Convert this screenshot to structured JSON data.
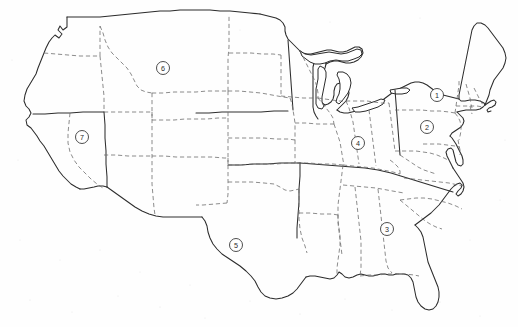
{
  "document": {
    "kind": "outline-map",
    "subject": "United States",
    "width": 518,
    "height": 327,
    "background_color": "#fefefe",
    "ink_color": "#2b2b2b",
    "state_border_color": "#6f6f6f",
    "render_style": "photocopied line drawing, no labels"
  },
  "legend": {
    "coast_line_style": "solid",
    "region_divider_style": "solid",
    "state_divider_style": "dashed"
  },
  "markers": [
    {
      "id": "marker-1",
      "label": "1",
      "cx": 437,
      "cy": 95,
      "r": 6.5,
      "region": "New York / New England"
    },
    {
      "id": "marker-2",
      "label": "2",
      "cx": 427,
      "cy": 127,
      "r": 6.5,
      "region": "Pennsylvania / Mid-Atlantic"
    },
    {
      "id": "marker-3",
      "label": "3",
      "cx": 387,
      "cy": 229,
      "r": 6.5,
      "region": "Georgia / South Carolina"
    },
    {
      "id": "marker-4",
      "label": "4",
      "cx": 358,
      "cy": 143,
      "r": 6.5,
      "region": "Indiana / Ohio"
    },
    {
      "id": "marker-5",
      "label": "5",
      "cx": 236,
      "cy": 245,
      "r": 6.5,
      "region": "Texas"
    },
    {
      "id": "marker-6",
      "label": "6",
      "cx": 163,
      "cy": 68,
      "r": 6.5,
      "region": "Montana"
    },
    {
      "id": "marker-7",
      "label": "7",
      "cx": 82,
      "cy": 137,
      "r": 6.5,
      "region": "Nevada / Utah"
    }
  ],
  "geometry": {
    "outline": "M 38 118 L 36 110 L 33 103 L 31 96 L 32 90 L 34 84 L 38 80 L 42 74 L 46 69 L 49 62 L 52 56 L 55 50 L 58 44 L 60 38 L 62 32 L 64 26 L 66 21 L 68 18 L 70 20 L 71 26 L 70 32 L 72 36 L 76 33 L 79 29 L 81 24 L 83 20 L 86 18 L 88 22 L 87 28 L 85 33 L 84 38 L 86 41 L 90 40 L 95 37 L 100 33 L 104 29 L 108 26 L 112 23 L 117 21 L 122 19 L 128 17 L 135 15 L 143 13 L 152 12 L 162 11 L 173 10 L 185 9 L 197 9 L 210 9 L 222 9 L 234 10 L 246 11 L 258 12 L 268 14 L 276 17 L 282 22 L 285 28 L 286 34 L 288 40 L 292 44 L 297 47 L 303 49 L 310 50 L 316 50 L 321 48 L 325 45 L 328 42 L 331 44 L 333 48 L 334 53 L 336 57 L 340 60 L 345 61 L 350 60 L 354 57 L 357 53 L 360 49 L 364 46 L 368 44 L 372 45 L 375 48 L 377 52 L 378 57 L 380 61 L 384 64 L 389 65 L 394 64 L 399 62 L 404 59 L 409 56 L 414 52 L 419 48 L 424 44 L 429 41 L 434 38 L 439 34 L 443 30 L 446 25 L 449 20 L 452 16 L 456 13 L 461 12 L 466 13 L 470 16 L 473 20 L 476 25 L 479 30 L 482 35 L 485 40 L 488 45 L 491 50 L 494 55 L 496 60 L 497 65 L 496 70 L 493 74 L 489 77 L 485 80 L 481 83 L 477 86 L 473 89 L 469 92 L 466 96 L 464 100 L 462 104 L 459 107 L 455 109 L 451 110 L 447 112 L 444 115 L 442 119 L 440 123 L 437 126 L 434 129 L 431 132 L 428 136 L 426 140 L 425 145 L 427 149 L 430 152 L 433 155 L 436 159 L 438 164 L 439 169 L 440 175 L 441 181 L 443 187 L 446 192 L 449 197 L 452 202 L 454 207 L 455 213 L 454 219 L 452 224 L 449 229 L 446 234 L 443 239 L 440 244 L 437 249 L 434 254 L 431 259 L 428 264 L 425 269 L 422 274 L 418 278 L 414 281 L 410 283 L 406 284 L 402 283 L 399 280 L 397 276 L 396 271 L 396 266 L 397 261 L 397 256 L 396 251 L 394 246 L 392 241 L 389 237 L 386 234 L 382 232 L 378 231 L 374 231 L 370 232 L 366 233 L 362 234 L 358 235 L 354 236 L 350 237 L 346 238 L 342 238 L 338 237 L 334 236 L 330 235 L 326 235 L 322 236 L 318 237 L 314 238 L 310 238 L 306 237 L 302 236 L 298 235 L 294 235 L 290 236 L 287 238 L 284 241 L 282 245 L 280 249 L 277 252 L 274 254 L 270 255 L 266 255 L 262 254 L 258 253 L 254 253 L 250 254 L 247 257 L 245 261 L 243 266 L 241 271 L 239 276 L 237 281 L 235 286 L 232 290 L 229 293 L 226 294 L 223 293 L 221 290 L 220 286 L 220 281 L 221 276 L 222 271 L 223 266 L 223 261 L 222 256 L 220 252 L 217 249 L 213 247 L 209 246 L 205 246 L 201 247 L 198 249 L 195 251 L 192 252 L 189 252 L 187 250 L 186 247 L 186 243 L 187 239 L 188 235 L 188 231 L 187 227 L 185 224 L 182 222 L 178 221 L 174 221 L 170 222 L 166 223 L 162 223 L 159 222 L 157 219 L 156 215 L 155 211 L 153 207 L 150 204 L 146 202 L 142 201 L 138 200 L 134 199 L 130 197 L 127 194 L 124 191 L 121 189 L 117 188 L 113 188 L 109 189 L 105 190 L 101 190 L 98 188 L 96 185 L 94 181 L 92 177 L 89 174 L 86 172 L 82 171 L 78 170 L 74 168 L 71 165 L 68 162 L 65 159 L 62 156 L 59 153 L 56 150 L 53 146 L 50 142 L 47 138 L 44 133 L 41 128 L 38 123 Z"
  }
}
